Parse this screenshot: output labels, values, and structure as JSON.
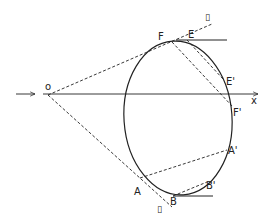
{
  "figure": {
    "labels": {
      "origin": "o",
      "x_axis": "x",
      "F": "F",
      "E": "E",
      "E_prime": "E'",
      "F_prime": "F'",
      "A_prime": "A'",
      "B_prime": "B'",
      "A": "A",
      "B": "B",
      "top_symbol": "▯",
      "bottom_symbol": "▯"
    },
    "colors": {
      "stroke": "#222222",
      "background": "#ffffff"
    }
  }
}
